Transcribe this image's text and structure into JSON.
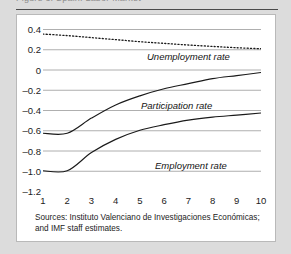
{
  "figure": {
    "cutoff_heading": "Figure 3. Spain: Labor Market",
    "source_note": "Sources: Instituto Valenciano de Investigaciones Económicas; and IMF staff estimates."
  },
  "chart_data": {
    "type": "line",
    "title": "",
    "xlabel": "",
    "ylabel": "",
    "xlim": [
      1,
      10
    ],
    "ylim": [
      -1.2,
      0.4
    ],
    "grid": true,
    "legend_position": "inline-labels",
    "x": [
      1,
      2,
      3,
      4,
      5,
      6,
      7,
      8,
      9,
      10
    ],
    "yticks": [
      "0.4",
      "0.2",
      "0",
      "-0.2",
      "-0.4",
      "-0.6",
      "-0.8",
      "-1.0",
      "-1.2"
    ],
    "ytick_values": [
      0.4,
      0.2,
      0,
      -0.2,
      -0.4,
      -0.6,
      -0.8,
      -1.0,
      -1.2
    ],
    "xticks": [
      "1",
      "2",
      "3",
      "4",
      "5",
      "6",
      "7",
      "8",
      "9",
      "10"
    ],
    "series": [
      {
        "name": "Unemployment rate",
        "style": "dotted",
        "color": "#1a1a1a",
        "values": [
          0.35,
          0.335,
          0.315,
          0.295,
          0.275,
          0.258,
          0.242,
          0.228,
          0.215,
          0.205
        ]
      },
      {
        "name": "Participation rate",
        "style": "solid",
        "color": "#1a1a1a",
        "values": [
          -0.63,
          -0.63,
          -0.48,
          -0.35,
          -0.26,
          -0.19,
          -0.14,
          -0.09,
          -0.06,
          -0.03
        ]
      },
      {
        "name": "Employment rate",
        "style": "solid",
        "color": "#1a1a1a",
        "values": [
          -1.0,
          -1.0,
          -0.82,
          -0.69,
          -0.6,
          -0.545,
          -0.5,
          -0.47,
          -0.45,
          -0.43
        ]
      }
    ]
  }
}
